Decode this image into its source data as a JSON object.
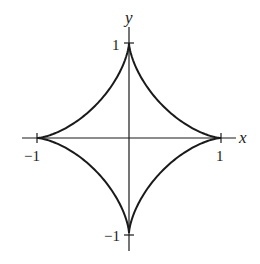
{
  "figure": {
    "curve": {
      "name": "astroid",
      "parametric": {
        "x": "cos^3(t)",
        "y": "sin^3(t)"
      },
      "t_range": [
        0,
        6.2832
      ],
      "color": "#1a1a1a",
      "cusps": [
        [
          1,
          0
        ],
        [
          0,
          1
        ],
        [
          -1,
          0
        ],
        [
          0,
          -1
        ]
      ]
    },
    "axes": {
      "x_label": "x",
      "y_label": "y",
      "color": "#1a1a1a",
      "xlim": [
        -1.16,
        1.16
      ],
      "ylim": [
        -1.16,
        1.16
      ]
    },
    "ticks": {
      "x_pos_label": "1",
      "x_neg_label": "−1",
      "y_pos_label": "1",
      "y_neg_label": "−1"
    }
  },
  "chart_data": {
    "type": "line",
    "title": "",
    "xlabel": "x",
    "ylabel": "y",
    "xlim": [
      -1.16,
      1.16
    ],
    "ylim": [
      -1.16,
      1.16
    ],
    "grid": false,
    "legend": null,
    "x_ticks": [
      -1,
      1
    ],
    "y_ticks": [
      -1,
      1
    ],
    "x_tick_labels": [
      "−1",
      "1"
    ],
    "y_tick_labels": [
      "−1",
      "1"
    ],
    "series": [
      {
        "name": "astroid",
        "x": [
          1,
          0.65,
          0.354,
          0.125,
          0.0,
          -0.125,
          -0.354,
          -0.65,
          -1,
          -0.65,
          -0.354,
          -0.125,
          0.0,
          0.125,
          0.354,
          0.65,
          1
        ],
        "y": [
          0,
          0.043,
          0.354,
          0.65,
          1,
          0.65,
          0.354,
          0.043,
          0,
          -0.043,
          -0.354,
          -0.65,
          -1,
          -0.65,
          -0.354,
          -0.043,
          0
        ]
      }
    ]
  }
}
